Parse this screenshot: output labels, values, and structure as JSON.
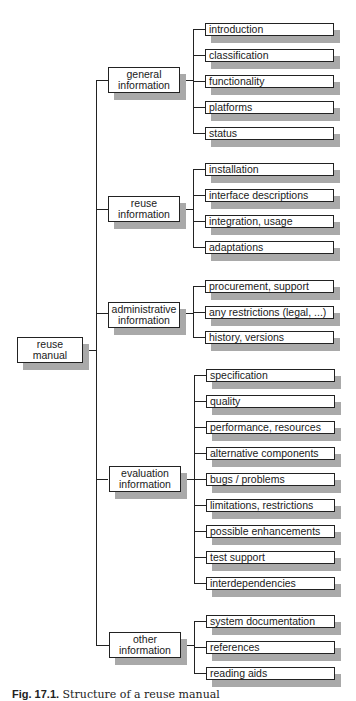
{
  "diagram": {
    "root": {
      "line1": "reuse",
      "line2": "manual"
    },
    "groups": [
      {
        "line1": "general",
        "line2": "information",
        "children": [
          "introduction",
          "classification",
          "functionality",
          "platforms",
          "status"
        ]
      },
      {
        "line1": "reuse",
        "line2": "information",
        "children": [
          "installation",
          "interface descriptions",
          "integration, usage",
          "adaptations"
        ]
      },
      {
        "line1": "administrative",
        "line2": "information",
        "children": [
          "procurement, support",
          "any restrictions (legal, ...)",
          "history, versions"
        ]
      },
      {
        "line1": "evaluation",
        "line2": "information",
        "children": [
          "specification",
          "quality",
          "performance, resources",
          "alternative components",
          "bugs / problems",
          "limitations, restrictions",
          "possible enhancements",
          "test support",
          "interdependencies"
        ]
      },
      {
        "line1": "other",
        "line2": "information",
        "children": [
          "system documentation",
          "references",
          "reading aids"
        ]
      }
    ]
  },
  "caption": {
    "label": "Fig. 17.1.",
    "text": "Structure of a reuse manual"
  },
  "colors": {
    "line": "#222222",
    "shadow": "#a9a9a9",
    "box_fill": "#ffffff"
  }
}
